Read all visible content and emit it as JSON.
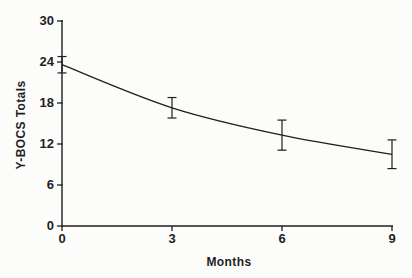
{
  "colors": {
    "background": "#fcfcfa",
    "ink": "#1f1f1f"
  },
  "chart_data": {
    "type": "line",
    "title": "",
    "xlabel": "Months",
    "ylabel": "Y-BOCS Totals",
    "x": [
      0,
      3,
      6,
      9
    ],
    "y": [
      23.6,
      17.3,
      13.3,
      10.5
    ],
    "error_bars": [
      1.2,
      1.5,
      2.2,
      2.1
    ],
    "xticks": [
      "0",
      "3",
      "6",
      "9"
    ],
    "yticks": [
      "0",
      "6",
      "12",
      "18",
      "24",
      "30"
    ],
    "xlim": [
      0,
      9
    ],
    "ylim": [
      0,
      30
    ],
    "grid": false,
    "legend": "none",
    "marker": "none"
  }
}
